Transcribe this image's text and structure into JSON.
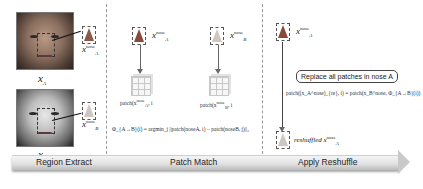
{
  "stages": [
    {
      "label": "Region Extract"
    },
    {
      "label": "Patch Match"
    },
    {
      "label": "Apply Reshuffle"
    }
  ],
  "region_extract": {
    "face_a_label": "x",
    "face_a_sub": "A",
    "face_b_label": "x",
    "face_b_sub": "B",
    "nose_a_label": "x",
    "nose_a_sup": "nose",
    "nose_a_sub": "A",
    "nose_b_label": "x",
    "nose_b_sup": "nose",
    "nose_b_sub": "B"
  },
  "patch_match": {
    "nose_a_label": "x",
    "nose_a_sup": "nose",
    "nose_a_sub": "A",
    "nose_b_label": "x",
    "nose_b_sup": "nose",
    "nose_b_sub": "B",
    "patch_a_text": "patch(x",
    "patch_a_sup": "nose",
    "patch_a_sub": "A",
    "patch_a_tail": ", i",
    "patch_b_text": "patch(x",
    "patch_b_sup": "nose",
    "patch_b_sub": "B",
    "patch_b_tail": ", i",
    "formula": "Φ_{A→B}(i) = argmin_j ||patch(noseA, i) − patch(noseB, j)||₂"
  },
  "apply_reshuffle": {
    "nose_top_label": "x",
    "nose_top_sup": "nose",
    "nose_top_sub": "A",
    "replace_label": "Replace all patches in nose A",
    "formula": "patch((x_A^nose)_{re}, i) = patch(x_B^nose, Φ_{A→B}(i))",
    "reshuffled_prefix": "reshuffled",
    "reshuffled_label": "x",
    "reshuffled_sup": "nose",
    "reshuffled_sub": "A"
  }
}
